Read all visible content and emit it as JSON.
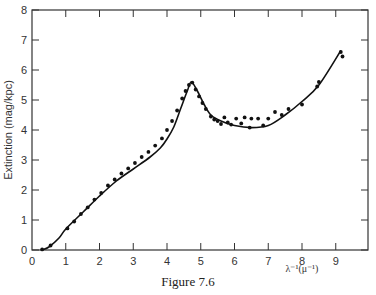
{
  "caption": "Figure 7.6",
  "chart_data": {
    "type": "scatter",
    "title": "",
    "xlabel": "λ⁻¹(μ⁻¹)",
    "ylabel": "Extinction (mag/kpc)",
    "xlim": [
      0,
      10
    ],
    "ylim": [
      0,
      8
    ],
    "x_ticks": [
      0,
      1,
      2,
      3,
      4,
      5,
      6,
      7,
      8,
      9
    ],
    "y_ticks": [
      0,
      1,
      2,
      3,
      4,
      5,
      6,
      7,
      8
    ],
    "grid": false,
    "legend": null,
    "series": [
      {
        "name": "fit curve",
        "kind": "line",
        "x": [
          0.3,
          0.5,
          0.8,
          1.0,
          1.5,
          2.0,
          2.5,
          3.0,
          3.5,
          3.8,
          4.0,
          4.2,
          4.4,
          4.6,
          4.72,
          4.9,
          5.1,
          5.3,
          5.6,
          6.0,
          6.5,
          7.0,
          7.5,
          8.0,
          8.5,
          9.15
        ],
        "y": [
          0.0,
          0.1,
          0.4,
          0.7,
          1.25,
          1.8,
          2.3,
          2.7,
          3.1,
          3.4,
          3.7,
          4.1,
          4.7,
          5.3,
          5.6,
          5.3,
          4.85,
          4.5,
          4.3,
          4.15,
          4.08,
          4.15,
          4.5,
          4.95,
          5.5,
          6.65
        ]
      },
      {
        "name": "observed",
        "kind": "points",
        "x": [
          0.3,
          0.55,
          1.05,
          1.25,
          1.45,
          1.65,
          1.85,
          2.05,
          2.25,
          2.45,
          2.65,
          2.85,
          3.05,
          3.25,
          3.45,
          3.65,
          3.85,
          4.0,
          4.15,
          4.3,
          4.45,
          4.55,
          4.65,
          4.75,
          4.85,
          4.95,
          5.05,
          5.15,
          5.3,
          5.4,
          5.5,
          5.6,
          5.7,
          5.8,
          5.9,
          6.05,
          6.2,
          6.3,
          6.45,
          6.5,
          6.7,
          6.85,
          7.0,
          7.2,
          7.4,
          7.6,
          8.0,
          8.45,
          8.5,
          9.15,
          9.2
        ],
        "y": [
          0.02,
          0.15,
          0.72,
          0.95,
          1.2,
          1.42,
          1.68,
          1.9,
          2.15,
          2.35,
          2.55,
          2.72,
          2.9,
          3.1,
          3.27,
          3.48,
          3.72,
          4.0,
          4.3,
          4.65,
          5.05,
          5.3,
          5.5,
          5.58,
          5.35,
          5.12,
          4.9,
          4.7,
          4.45,
          4.35,
          4.3,
          4.2,
          4.42,
          4.25,
          4.18,
          4.38,
          4.22,
          4.42,
          4.08,
          4.38,
          4.38,
          4.15,
          4.38,
          4.6,
          4.5,
          4.7,
          4.85,
          5.45,
          5.6,
          6.6,
          6.45
        ]
      }
    ]
  }
}
